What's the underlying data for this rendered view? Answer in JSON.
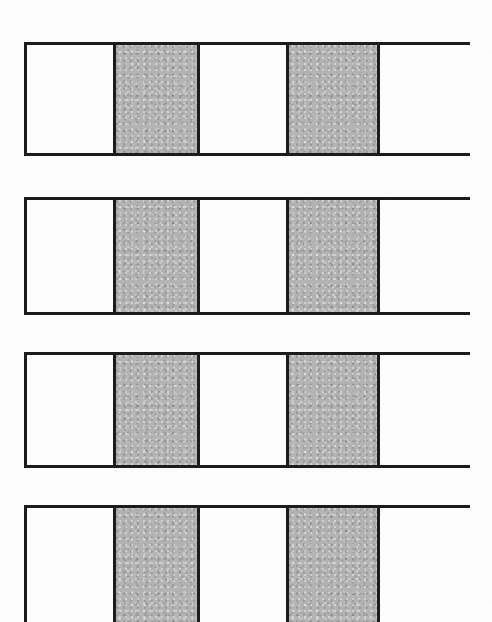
{
  "figure": {
    "canvas": {
      "width": 492,
      "height": 622,
      "background": "#ffffff"
    },
    "style": {
      "border_color": "#1c1c1c",
      "border_width_px": 3,
      "fill_white": "#ffffff",
      "fill_gray": "#b5b5b5"
    },
    "cell_pattern": [
      "white",
      "gray",
      "white",
      "gray",
      "white"
    ],
    "cell_widths_px": [
      89,
      84,
      89,
      91,
      93
    ],
    "bars": [
      {
        "index": 1,
        "name": "bar-1",
        "x": 24,
        "y": 42,
        "width": 446,
        "height": 114,
        "clipped_bottom": false,
        "cells": [
          {
            "index": 1,
            "fill": "white"
          },
          {
            "index": 2,
            "fill": "gray"
          },
          {
            "index": 3,
            "fill": "white"
          },
          {
            "index": 4,
            "fill": "gray"
          },
          {
            "index": 5,
            "fill": "white"
          }
        ]
      },
      {
        "index": 2,
        "name": "bar-2",
        "x": 24,
        "y": 197,
        "width": 446,
        "height": 118,
        "clipped_bottom": false,
        "cells": [
          {
            "index": 1,
            "fill": "white"
          },
          {
            "index": 2,
            "fill": "gray"
          },
          {
            "index": 3,
            "fill": "white"
          },
          {
            "index": 4,
            "fill": "gray"
          },
          {
            "index": 5,
            "fill": "white"
          }
        ]
      },
      {
        "index": 3,
        "name": "bar-3",
        "x": 24,
        "y": 352,
        "width": 446,
        "height": 116,
        "clipped_bottom": false,
        "cells": [
          {
            "index": 1,
            "fill": "white"
          },
          {
            "index": 2,
            "fill": "gray"
          },
          {
            "index": 3,
            "fill": "white"
          },
          {
            "index": 4,
            "fill": "gray"
          },
          {
            "index": 5,
            "fill": "white"
          }
        ]
      },
      {
        "index": 4,
        "name": "bar-4",
        "x": 24,
        "y": 505,
        "width": 446,
        "height": 117,
        "clipped_bottom": true,
        "cells": [
          {
            "index": 1,
            "fill": "white"
          },
          {
            "index": 2,
            "fill": "gray"
          },
          {
            "index": 3,
            "fill": "white"
          },
          {
            "index": 4,
            "fill": "gray"
          },
          {
            "index": 5,
            "fill": "white"
          }
        ]
      }
    ]
  }
}
